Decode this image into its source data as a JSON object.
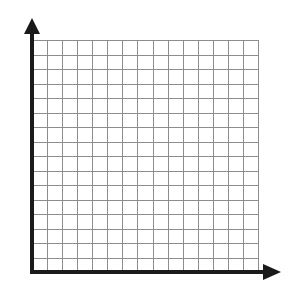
{
  "figure": {
    "background_color": "#ffffff",
    "width": 286,
    "height": 297
  },
  "axes": {
    "color": "#1a1a1a",
    "line_width": 4,
    "origin": {
      "x": 32,
      "y": 272
    },
    "y_axis": {
      "name": "vertical-axis",
      "label": "",
      "from_y": 272,
      "to_y": 28,
      "arrow": {
        "name": "y-axis-arrowhead",
        "direction": "up",
        "tip_x": 32,
        "tip_y": 18,
        "half_width": 8,
        "length": 16
      }
    },
    "x_axis": {
      "name": "horizontal-axis",
      "label": "",
      "from_x": 32,
      "to_x": 262,
      "arrow": {
        "name": "x-axis-arrowhead",
        "direction": "right",
        "tip_x": 281,
        "tip_y": 272,
        "half_width": 8,
        "length": 18
      }
    }
  },
  "grid": {
    "name": "coordinate-grid",
    "columns": 15,
    "rows": 16,
    "left": 32,
    "top": 40,
    "right": 258,
    "bottom": 272,
    "cell_width": 15.07,
    "cell_height": 14.5,
    "line_color": "#8d8d8d",
    "line_width": 1,
    "fill": "#ffffff",
    "show_tick_labels": false,
    "show_axis_labels": false
  },
  "chart_data": {
    "type": "scatter",
    "title": "",
    "subtitle": "",
    "xlabel": "",
    "ylabel": "",
    "series": [
      {
        "name": "",
        "x": [],
        "y": []
      }
    ],
    "categories": [],
    "values": [],
    "xlim": [
      0,
      15
    ],
    "ylim": [
      0,
      16
    ],
    "xticks": [
      0,
      1,
      2,
      3,
      4,
      5,
      6,
      7,
      8,
      9,
      10,
      11,
      12,
      13,
      14,
      15
    ],
    "yticks": [
      0,
      1,
      2,
      3,
      4,
      5,
      6,
      7,
      8,
      9,
      10,
      11,
      12,
      13,
      14,
      15,
      16
    ],
    "xticklabels": [],
    "yticklabels": [],
    "grid": true,
    "legend": null,
    "annotations": []
  }
}
